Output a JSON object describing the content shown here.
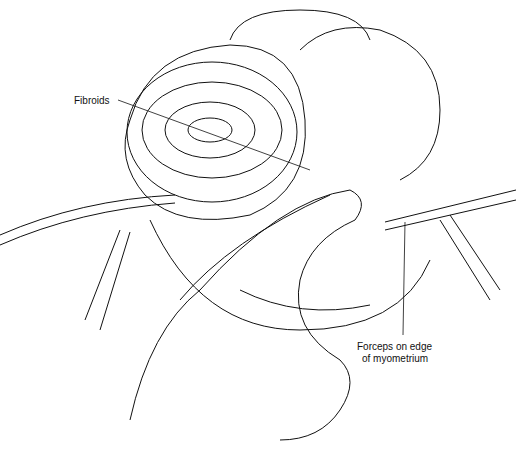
{
  "illustration": {
    "subject": "surgical illustration of fibroid removal",
    "labels": {
      "fibroids": "Fibroids",
      "forceps_line1": "Forceps on edge",
      "forceps_line2": "of myometrium"
    },
    "colors": {
      "ink": "#111111",
      "background": "#ffffff"
    }
  }
}
